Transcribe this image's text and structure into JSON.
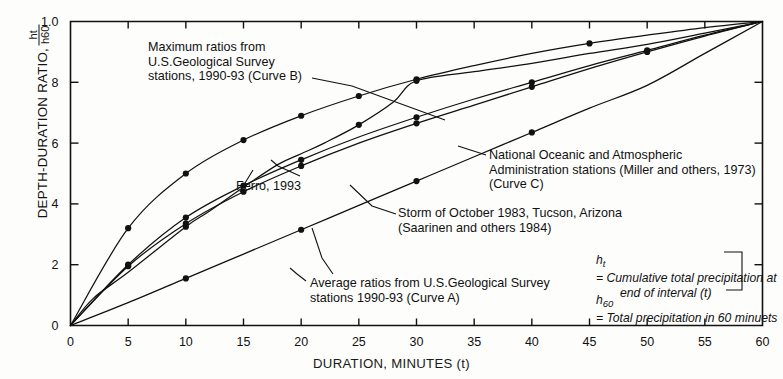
{
  "chart_data": {
    "type": "line",
    "title": "",
    "xlabel": "DURATION, MINUTES (t)",
    "ylabel": "DEPTH-DURATION RATIO,",
    "ylabel_fraction_numerator": "ht",
    "ylabel_fraction_denominator": "h60",
    "xlim": [
      0,
      60
    ],
    "ylim": [
      0,
      1.0
    ],
    "xticks": [
      0,
      5,
      10,
      15,
      20,
      25,
      30,
      35,
      40,
      45,
      50,
      55,
      60
    ],
    "xticklabels": [
      "0",
      "5",
      "10",
      "15",
      "20",
      "25",
      "30",
      "35",
      "40",
      "45",
      "50",
      "55",
      "60"
    ],
    "yticks": [
      0,
      0.2,
      0.4,
      0.6,
      0.8,
      1.0
    ],
    "yticklabels": [
      "0",
      "2",
      "4",
      "6",
      "8",
      "1.0"
    ],
    "grid": false,
    "legend_position": "annotations-inline",
    "series": [
      {
        "name": "Maximum ratios from U.S.Geological Survey stations, 1990-93 (Curve B)",
        "curve_letter": "B",
        "x": [
          0,
          5,
          10,
          15,
          20,
          25,
          30,
          35,
          40,
          45,
          50,
          55,
          60
        ],
        "y": [
          0.0,
          0.32,
          0.5,
          0.61,
          0.69,
          0.755,
          0.81,
          0.855,
          0.895,
          0.928,
          0.955,
          0.98,
          1.0
        ],
        "markers_x": [
          5,
          10,
          15,
          20,
          25,
          30,
          45
        ],
        "markers_y": [
          0.32,
          0.5,
          0.61,
          0.69,
          0.755,
          0.81,
          0.928
        ]
      },
      {
        "name": "National Oceanic and Atmospheric Administration stations (Miller and others, 1973) (Curve C)",
        "curve_letter": "C",
        "x": [
          0,
          5,
          10,
          15,
          20,
          25,
          30,
          35,
          40,
          45,
          50,
          55,
          60
        ],
        "y": [
          0.0,
          0.2,
          0.355,
          0.46,
          0.545,
          0.62,
          0.685,
          0.745,
          0.8,
          0.855,
          0.905,
          0.955,
          1.0
        ],
        "markers_x": [
          5,
          10,
          15,
          20,
          30,
          40,
          50
        ],
        "markers_y": [
          0.2,
          0.355,
          0.46,
          0.545,
          0.685,
          0.8,
          0.905
        ]
      },
      {
        "name": "Ferro, 1993",
        "curve_letter": "",
        "x": [
          0,
          5,
          10,
          15,
          20,
          25,
          30,
          35,
          40,
          45,
          50,
          55,
          60
        ],
        "y": [
          0.0,
          0.195,
          0.335,
          0.44,
          0.525,
          0.6,
          0.665,
          0.725,
          0.785,
          0.845,
          0.9,
          0.952,
          1.0
        ],
        "markers_x": [
          5,
          10,
          15,
          20,
          30,
          40,
          50
        ],
        "markers_y": [
          0.195,
          0.335,
          0.44,
          0.525,
          0.665,
          0.785,
          0.9
        ]
      },
      {
        "name": "Storm of October 1983, Tucson, Arizona (Saarinen and others 1984)",
        "curve_letter": "",
        "x": [
          0,
          2,
          5,
          10,
          12,
          15,
          18,
          20,
          22,
          25,
          28,
          30,
          35,
          40,
          45,
          50,
          55,
          60
        ],
        "y": [
          0.0,
          0.09,
          0.175,
          0.325,
          0.375,
          0.455,
          0.53,
          0.565,
          0.6,
          0.66,
          0.735,
          0.805,
          0.835,
          0.862,
          0.895,
          0.925,
          0.962,
          1.0
        ],
        "markers_x": [
          10,
          25,
          30
        ],
        "markers_y": [
          0.325,
          0.66,
          0.805
        ]
      },
      {
        "name": "Average ratios from U.S.Geological Survey stations 1990-93 (Curve A)",
        "curve_letter": "A",
        "x": [
          0,
          5,
          10,
          15,
          20,
          25,
          30,
          35,
          40,
          45,
          50,
          55,
          60
        ],
        "y": [
          0.0,
          0.075,
          0.155,
          0.235,
          0.315,
          0.395,
          0.475,
          0.555,
          0.635,
          0.715,
          0.79,
          0.895,
          1.0
        ],
        "markers_x": [
          10,
          20,
          30,
          40
        ],
        "markers_y": [
          0.155,
          0.315,
          0.475,
          0.635
        ]
      }
    ]
  },
  "annotations": {
    "curve_b": "Maximum ratios from\nU.S.Geological Survey\nstations, 1990-93 (Curve B)",
    "curve_c": "National Oceanic and Atmospheric\nAdministration stations (Miller and others, 1973)\n   (Curve C)",
    "ferro": "Ferro, 1993",
    "storm": "Storm of October 1983, Tucson, Arizona\n(Saarinen and others 1984)",
    "curve_a": "Average ratios from U.S.Geological Survey\nstations 1990-93 (Curve A)",
    "note_ht": "= Cumulative total precipitation at",
    "note_ht_line2": "end of interval (t)",
    "note_h60": "= Total precipitation in 60 minuets",
    "note_ht_symbol": "h",
    "note_ht_sub": "t",
    "note_h60_symbol": "h",
    "note_h60_sub": "60"
  }
}
